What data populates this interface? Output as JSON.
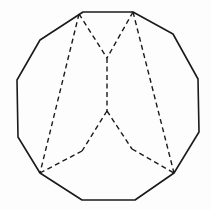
{
  "diagram": {
    "type": "polygon-net",
    "colors": {
      "stroke": "#1a1a1a",
      "background": "#fdfdfd"
    },
    "outline_vertices": [
      [
        83,
        12
      ],
      [
        133,
        12
      ],
      [
        173,
        34
      ],
      [
        198,
        79
      ],
      [
        199,
        132
      ],
      [
        174,
        173
      ],
      [
        135,
        200
      ],
      [
        82,
        200
      ],
      [
        40,
        173
      ],
      [
        18,
        137
      ],
      [
        17,
        80
      ],
      [
        40,
        40
      ]
    ],
    "interior_vertices": {
      "upper_center": [
        107,
        58
      ],
      "lower_center": [
        107,
        111
      ],
      "inner_left": [
        82,
        151
      ],
      "inner_right": [
        132,
        149
      ]
    },
    "dashed_lines": [
      {
        "from": [
          79,
          14
        ],
        "to": [
          107,
          58
        ]
      },
      {
        "from": [
          133,
          12
        ],
        "to": [
          107,
          58
        ]
      },
      {
        "from": [
          107,
          58
        ],
        "to": [
          107,
          111
        ]
      },
      {
        "from": [
          107,
          111
        ],
        "to": [
          82,
          151
        ]
      },
      {
        "from": [
          82,
          151
        ],
        "to": [
          40,
          173
        ]
      },
      {
        "from": [
          107,
          111
        ],
        "to": [
          132,
          149
        ]
      },
      {
        "from": [
          132,
          149
        ],
        "to": [
          174,
          173
        ]
      },
      {
        "from": [
          79,
          14
        ],
        "to": [
          40,
          173
        ]
      },
      {
        "from": [
          133,
          12
        ],
        "to": [
          174,
          173
        ]
      }
    ]
  }
}
